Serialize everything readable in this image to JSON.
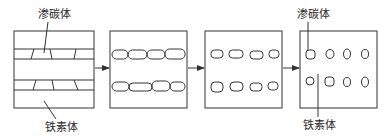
{
  "diagram": {
    "stages": [
      {
        "id": 1,
        "description": "lamellar carbide plates in ferrite"
      },
      {
        "id": 2,
        "description": "carbide broken into connected segments"
      },
      {
        "id": 3,
        "description": "separated rounded carbide particles"
      },
      {
        "id": 4,
        "description": "spheroidized carbide particles"
      }
    ],
    "labels": {
      "stage1_top": "渗碳体",
      "stage1_bottom": "铁素体",
      "stage4_top": "渗碳体",
      "stage4_bottom": "铁素体"
    },
    "arrows": 3,
    "colors": {
      "line": "#333333",
      "background": "#ffffff"
    }
  }
}
